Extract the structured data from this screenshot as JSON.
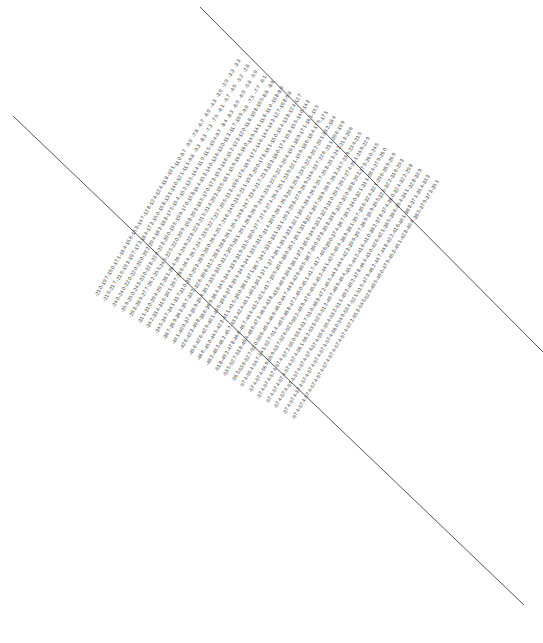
{
  "figure": {
    "width": 543,
    "height": 643,
    "background_color": "#ffffff",
    "label_color": "#3a3a3a",
    "line_color": "#555555",
    "label_rotation_deg": -62,
    "value_format": "one-decimal-negative"
  },
  "chart_data": {
    "type": "scatter",
    "title": "",
    "subtitle": "",
    "xlabel": "",
    "ylabel": "",
    "grid": false,
    "legend": null,
    "annotations": [],
    "lattice": {
      "rows": 24,
      "cols": 24,
      "origin_px": [
        233,
        66
      ],
      "col_step_px": [
        8.55,
        5.35
      ],
      "row_step_px": [
        -6.05,
        9.95
      ],
      "label_rotation_deg": -62
    },
    "value_model": {
      "note": "values are negative and grow in magnitude with distance from the top-right corner of the lattice",
      "base": -2.1,
      "per_col_px": -1.42,
      "per_row_px": -0.78,
      "per_col_row_px": -0.035,
      "jitter_amplitude": 1.15,
      "min": -57.4,
      "max": -2.0
    },
    "value_range": [
      -57.4,
      -2.0
    ],
    "sample_values": [
      -2.1,
      -2.8,
      -3.5,
      -4.3,
      -4.5,
      -4.8,
      -4.9,
      -5.1,
      -5.5,
      -6.4,
      -6.5,
      -6.6,
      -7.1,
      -7.4,
      -7.5,
      -7.6,
      -8.3,
      -8.8,
      -9.4,
      -10.1,
      -10.7,
      -11.3,
      -12.3,
      -12.4,
      -13.2,
      -13.4,
      -14.1,
      -14.5,
      -14.7,
      -15.2,
      -15.5,
      -16.1,
      -16.4,
      -17.0,
      -17.3,
      -17.9,
      -18.3,
      -18.8,
      -19.4,
      -19.6,
      -20.4,
      -21.2,
      -21.3,
      -22.1,
      -22.3,
      -23.3,
      -23.8,
      -24.5,
      -25.3,
      -25.5,
      -26.1,
      -27.3,
      -27.8,
      -28.4,
      -28.7,
      -29.8,
      -30.6,
      -31.1,
      -32.4,
      -33.5,
      -34.7,
      -35.5,
      -36.1,
      -37.3,
      -38.5,
      -39.4,
      -40.8,
      -41.9,
      -43.0,
      -44.2,
      -45.5,
      -46.3,
      -47.8,
      -48.9,
      -50.2,
      -51.5,
      -52.4,
      -53.3,
      -54.5,
      -55.7,
      -56.2,
      -57.4
    ]
  },
  "section_lines": [
    {
      "name": "upper-section-line",
      "x1": 13,
      "y1": 116,
      "x2": 524,
      "y2": 605
    },
    {
      "name": "lower-section-line",
      "x1": 200,
      "y1": 7,
      "x2": 543,
      "y2": 352
    }
  ]
}
